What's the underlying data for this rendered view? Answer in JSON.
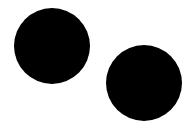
{
  "canvas": {
    "width": 193,
    "height": 130,
    "background": "#ffffff"
  },
  "shapes": [
    {
      "type": "circle",
      "cx": 52,
      "cy": 46,
      "r": 38,
      "fill": "#000000"
    },
    {
      "type": "circle",
      "cx": 144,
      "cy": 83,
      "r": 38,
      "fill": "#000000"
    }
  ]
}
